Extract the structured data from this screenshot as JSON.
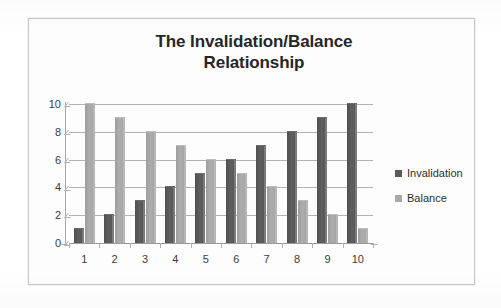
{
  "chart_data": {
    "type": "bar",
    "title": "The Invalidation/Balance Relationship",
    "title_line1": "The Invalidation/Balance",
    "title_line2": "Relationship",
    "xlabel": "",
    "ylabel": "",
    "ylim": [
      0,
      10
    ],
    "yticks": [
      0,
      2,
      4,
      6,
      8,
      10
    ],
    "grid": true,
    "legend_position": "right",
    "categories": [
      "1",
      "2",
      "3",
      "4",
      "5",
      "6",
      "7",
      "8",
      "9",
      "10"
    ],
    "series": [
      {
        "name": "Invalidation",
        "color": "#5a5a5a",
        "values": [
          1,
          2,
          3,
          4,
          5,
          6,
          7,
          8,
          9,
          10
        ]
      },
      {
        "name": "Balance",
        "color": "#a8a8a8",
        "values": [
          10,
          9,
          8,
          7,
          6,
          5,
          4,
          3,
          2,
          1
        ]
      }
    ]
  },
  "legend": {
    "items": [
      {
        "label": "Invalidation",
        "swatch": "invalidation"
      },
      {
        "label": "Balance",
        "swatch": "balance"
      }
    ]
  }
}
